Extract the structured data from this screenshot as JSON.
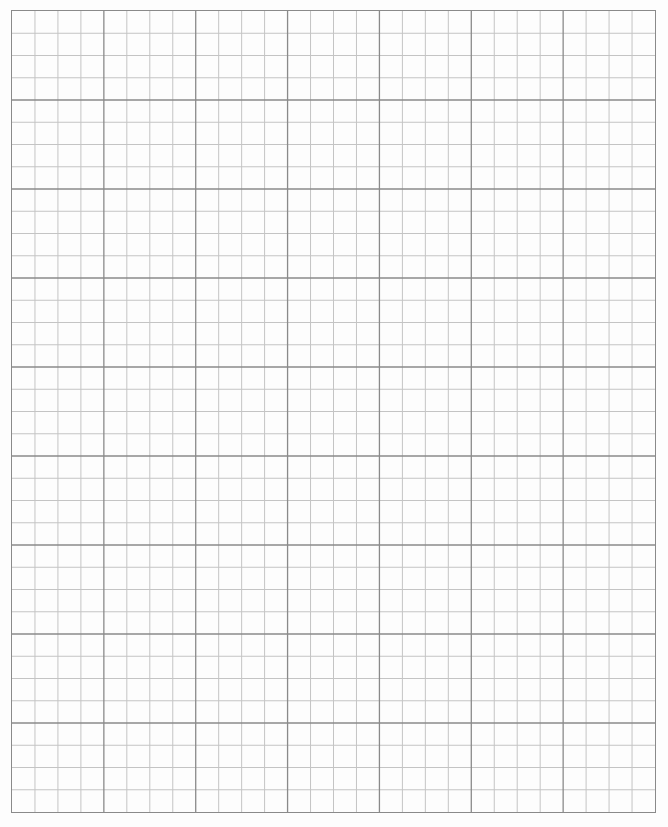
{
  "page": {
    "type": "graph-paper",
    "background_color": "#ffffff"
  },
  "grid": {
    "columns_minor": 28,
    "rows_minor": 36,
    "minor_per_major": 4,
    "columns_major": 7,
    "rows_major": 9,
    "minor_line_color": "#c4c4c4",
    "major_line_color": "#8a8a8a",
    "border_color": "#8a8a8a"
  }
}
